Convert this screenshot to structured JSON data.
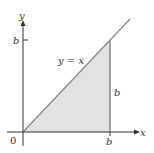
{
  "diagram": {
    "type": "region-plot",
    "axes": {
      "x_label": "x",
      "y_label": "y",
      "origin_label": "0"
    },
    "ticks": {
      "x_tick": "b",
      "y_tick": "b"
    },
    "line_label": "y = x",
    "side_label": "b",
    "colors": {
      "shade": "#e2e2e2",
      "line": "#8a8a8a",
      "axis": "#333333",
      "text": "#333333"
    }
  }
}
